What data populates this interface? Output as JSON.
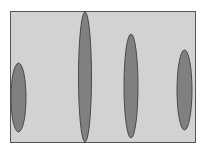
{
  "figure": {
    "name": "ellipse-row-diagram",
    "canvas": {
      "width": 206,
      "height": 152,
      "background": "#ffffff"
    },
    "frame": {
      "name": "plot-frame",
      "x": 10,
      "y": 11,
      "width": 186,
      "height": 132,
      "fill": "#d2d2d2",
      "border_color": "#545454",
      "border_width": 1
    },
    "shape_style": {
      "fill": "#808080",
      "stroke": "#4a4a4a",
      "stroke_width": 1
    }
  },
  "chart_data": {
    "type": "scatter",
    "title": "",
    "subtitle": "",
    "xlabel": "",
    "ylabel": "",
    "grid": false,
    "legend": null,
    "axis_ticks": [],
    "tick_labels": [],
    "annotations": [],
    "marker_shape": "ellipse",
    "xlim": [
      10,
      196
    ],
    "ylim": [
      11,
      143
    ],
    "series": [
      {
        "name": "ellipses",
        "points": [
          {
            "label": "ellipse-1",
            "cx": 18.5,
            "cy": 97.5,
            "rx": 7.5,
            "ry": 34.5,
            "height": 69,
            "width": 15,
            "top": 63,
            "bottom": 132
          },
          {
            "label": "ellipse-2",
            "cx": 85,
            "cy": 77,
            "rx": 6.5,
            "ry": 65,
            "height": 130,
            "width": 13,
            "top": 12,
            "bottom": 142
          },
          {
            "label": "ellipse-3",
            "cx": 131,
            "cy": 86,
            "rx": 7,
            "ry": 52,
            "height": 104,
            "width": 14,
            "top": 34,
            "bottom": 138
          },
          {
            "label": "ellipse-4",
            "cx": 184.5,
            "cy": 90,
            "rx": 7.5,
            "ry": 40,
            "height": 80,
            "width": 15,
            "top": 50,
            "bottom": 130
          }
        ]
      }
    ]
  }
}
